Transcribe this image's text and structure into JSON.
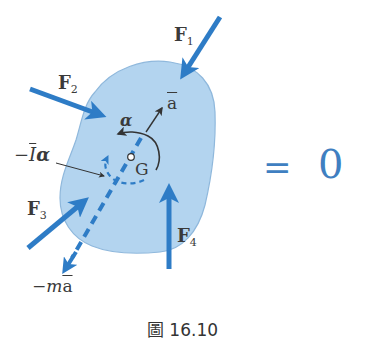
{
  "figure": {
    "caption": "圖 16.10",
    "equation": {
      "equals": "=",
      "rhs": "0"
    },
    "labels": {
      "F1": {
        "main": "F",
        "sub": "1"
      },
      "F2": {
        "main": "F",
        "sub": "2"
      },
      "F3": {
        "main": "F",
        "sub": "3"
      },
      "F4": {
        "main": "F",
        "sub": "4"
      },
      "a_bar": "a",
      "alpha": "α",
      "G": "G",
      "neg_I_alpha": {
        "prefix": "−",
        "I": "I",
        "alpha": "α"
      },
      "neg_m_a": {
        "prefix": "−m",
        "a": "a"
      }
    },
    "colors": {
      "body_fill": "#b3d4ef",
      "body_stroke": "#8fb8dc",
      "force_arrow": "#2e7cc6",
      "text_blue": "#2e74b5",
      "text_dark": "#3a3a3a",
      "equation": "#3f7fc1"
    }
  }
}
